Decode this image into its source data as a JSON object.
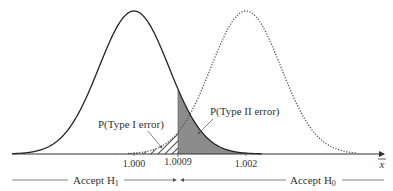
{
  "diagram": {
    "title": "",
    "axis": {
      "variable_label": "x̄",
      "ticks": [
        {
          "label": "1.000",
          "x": 134
        },
        {
          "label": "1.0009",
          "x": 178
        },
        {
          "label": "1.002",
          "x": 246
        }
      ]
    },
    "distributions": [
      {
        "name": "H0 distribution",
        "mean_label": "1.000",
        "style": "solid",
        "center_x": 134
      },
      {
        "name": "H1 distribution",
        "mean_label": "1.002",
        "style": "dotted",
        "center_x": 246
      }
    ],
    "regions": {
      "type_i": {
        "label": "P(Type I error)",
        "fill": "hatched"
      },
      "type_ii": {
        "label": "P(Type II error)",
        "fill": "#8c8c8c"
      }
    },
    "decision": {
      "accept_h1": {
        "text": "Accept H",
        "sub": "1"
      },
      "accept_h0": {
        "text": "Accept H",
        "sub": "0"
      }
    },
    "colors": {
      "curve": "#222222",
      "dotted_curve": "#555555",
      "shade": "#8c8c8c",
      "text": "#333333"
    }
  }
}
